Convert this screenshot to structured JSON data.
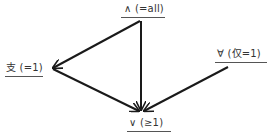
{
  "diagram": {
    "type": "lattice",
    "nodes": [
      {
        "id": "all",
        "label": "∧ (=all)"
      },
      {
        "id": "one",
        "label": "支 (=1)"
      },
      {
        "id": "only_one",
        "label": "∀ (仅=1)"
      },
      {
        "id": "at_least_one",
        "label": "∨ (≥1)"
      }
    ],
    "edges": [
      {
        "from": "all",
        "to": "one"
      },
      {
        "from": "all",
        "to": "at_least_one"
      },
      {
        "from": "one",
        "to": "at_least_one"
      },
      {
        "from": "only_one",
        "to": "at_least_one"
      }
    ],
    "colors": {
      "edge": "#1a1a1a",
      "text": "#333333",
      "underline": "#555555"
    }
  }
}
